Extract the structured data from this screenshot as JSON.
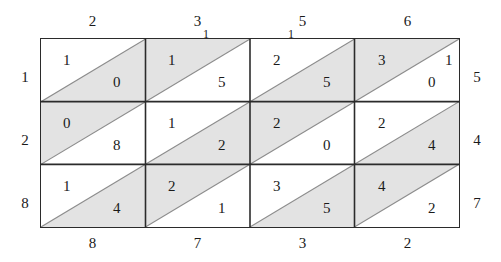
{
  "figure": {
    "type": "grid-diagram",
    "rows": 3,
    "cols": 4,
    "cell_split": "diagonal-bottom-left-to-top-right",
    "colors": {
      "shade": "#e3e3e3",
      "line": "#2b2b2b",
      "diagonal": "#8c8c8c",
      "text": "#1a1a1a",
      "background": "#ffffff"
    }
  },
  "labels": {
    "top": [
      "2",
      "3",
      "5",
      "6"
    ],
    "bottom": [
      "8",
      "7",
      "3",
      "2"
    ],
    "left": [
      "1",
      "2",
      "8"
    ],
    "right": [
      "5",
      "4",
      "7"
    ],
    "top_ticks": [
      "1",
      "1"
    ]
  },
  "grid": {
    "rows": [
      {
        "cells": [
          {
            "upper": "1",
            "lower": "0",
            "shaded": "lower"
          },
          {
            "upper": "1",
            "lower": "5",
            "shaded": "upper"
          },
          {
            "upper": "2",
            "lower": "5",
            "shaded": "lower"
          },
          {
            "upper": "3",
            "lower": "0",
            "shaded": "upper"
          }
        ]
      },
      {
        "cells": [
          {
            "upper": "0",
            "lower": "8",
            "shaded": "upper"
          },
          {
            "upper": "1",
            "lower": "2",
            "shaded": "lower"
          },
          {
            "upper": "2",
            "lower": "0",
            "shaded": "upper"
          },
          {
            "upper": "2",
            "lower": "4",
            "shaded": "lower"
          }
        ]
      },
      {
        "cells": [
          {
            "upper": "1",
            "lower": "4",
            "shaded": "lower"
          },
          {
            "upper": "2",
            "lower": "1",
            "shaded": "upper"
          },
          {
            "upper": "3",
            "lower": "5",
            "shaded": "lower"
          },
          {
            "upper": "4",
            "lower": "2",
            "shaded": "upper"
          }
        ]
      }
    ]
  },
  "corner": {
    "r1c4_extra": "1"
  }
}
